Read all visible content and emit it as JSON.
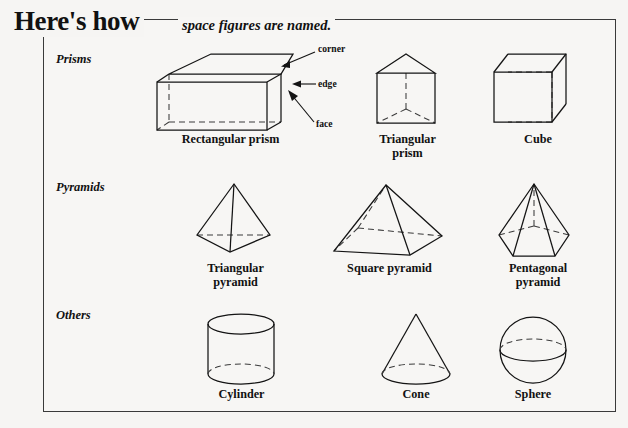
{
  "header": {
    "title": "Here's how",
    "subtitle": "space figures are named."
  },
  "rows": [
    {
      "label": "Prisms"
    },
    {
      "label": "Pyramids"
    },
    {
      "label": "Others"
    }
  ],
  "annotations": {
    "corner": "corner",
    "edge": "edge",
    "face": "face"
  },
  "figures": {
    "rectangular_prism": "Rectangular prism",
    "triangular_prism": "Triangular\nprism",
    "cube": "Cube",
    "triangular_pyramid": "Triangular\npyramid",
    "square_pyramid": "Square pyramid",
    "pentagonal_pyramid": "Pentagonal\npyramid",
    "cylinder": "Cylinder",
    "cone": "Cone",
    "sphere": "Sphere"
  },
  "colors": {
    "ink": "#141414",
    "hidden_edge": "#3b3b3b",
    "background": "#f6f5f3",
    "frame": "#3a3a3a"
  }
}
